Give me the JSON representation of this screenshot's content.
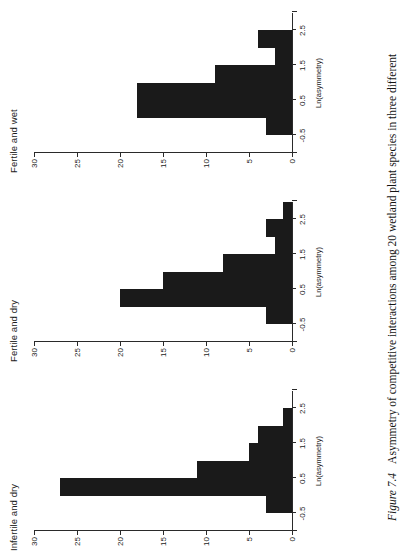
{
  "figure": {
    "number_label": "Figure 7.4",
    "caption_text": "Asymmetry of competitive interactions among 20 wetland plant species in three different",
    "y_axis_label": "Frequency",
    "x_axis_label": "Ln(asymmetry)",
    "ink_color": "#1a1a1a",
    "axis_color": "#2a2a2a"
  },
  "chart_data": {
    "type": "bar",
    "title": "Asymmetry of competitive interactions among 20 wetland plant species in three different",
    "xlabel": "Ln(asymmetry)",
    "ylabel": "Frequency",
    "ylim": [
      0,
      30
    ],
    "yticks": [
      0,
      5,
      10,
      15,
      20,
      25,
      30
    ],
    "ytick_labels": [
      "0",
      "5",
      "10",
      "15",
      "20",
      "25",
      "30"
    ],
    "xlim": [
      -1.0,
      3.0
    ],
    "xticks": [
      -0.5,
      0.5,
      1.5,
      2.5
    ],
    "xtick_labels": [
      "-0.5",
      "0.5",
      "1.5",
      "2.5"
    ],
    "grid": false,
    "legend": "none",
    "bin_width": 0.5,
    "panels": [
      {
        "name": "Infertile and dry",
        "bin_centers": [
          -0.75,
          -0.25,
          0.25,
          0.75,
          1.25,
          1.75,
          2.25
        ],
        "bin_left_edges": [
          -1.0,
          -0.5,
          0.0,
          0.5,
          1.0,
          1.5,
          2.0
        ],
        "values": [
          0,
          3,
          27,
          11,
          5,
          4,
          1
        ]
      },
      {
        "name": "Fertile and dry",
        "bin_centers": [
          -0.75,
          -0.25,
          0.25,
          0.75,
          1.25,
          1.75,
          2.25
        ],
        "bin_left_edges": [
          -1.0,
          -0.5,
          0.0,
          0.5,
          1.0,
          1.5,
          2.0
        ],
        "values": [
          0,
          3,
          20,
          15,
          8,
          2,
          3,
          1
        ]
      },
      {
        "name": "Fertile and wet",
        "bin_centers": [
          -0.75,
          -0.25,
          0.25,
          0.75,
          1.25,
          1.75,
          2.25
        ],
        "bin_left_edges": [
          -1.0,
          -0.5,
          0.0,
          0.5,
          1.0,
          1.5,
          2.0
        ],
        "values": [
          0,
          3,
          18,
          18,
          9,
          2,
          4
        ]
      }
    ]
  }
}
